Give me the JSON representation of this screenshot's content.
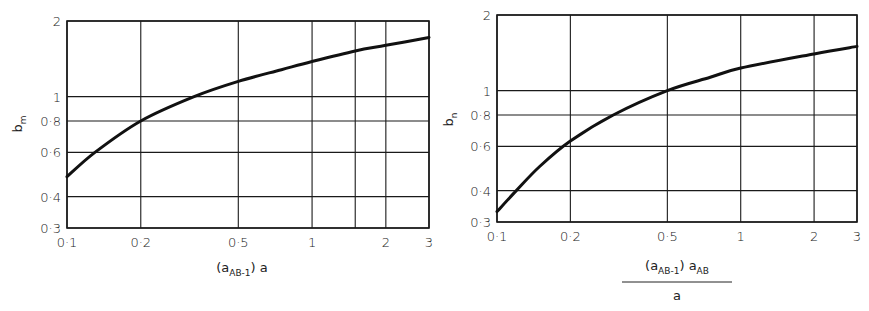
{
  "chart_data": [
    {
      "type": "line",
      "title": "",
      "xscale": "log",
      "yscale": "log",
      "xlabel": "(a_AB-1) a",
      "xlabel_parts": {
        "open": "(a",
        "sub": "AB-1",
        "close": ") a"
      },
      "ylabel": "b_m",
      "ylabel_parts": {
        "main": "b",
        "sub": "m"
      },
      "xlim": [
        0.1,
        3
      ],
      "ylim": [
        0.3,
        2
      ],
      "xticks": [
        0.1,
        0.2,
        0.5,
        1,
        2,
        3
      ],
      "xtick_labels": [
        "0·1",
        "0·2",
        "0·5",
        "1",
        "2",
        "3"
      ],
      "x_gridlines": [
        0.1,
        0.2,
        0.5,
        1,
        1.5,
        2,
        3
      ],
      "yticks": [
        0.3,
        0.4,
        0.6,
        0.8,
        1,
        2
      ],
      "ytick_labels": [
        "0·3",
        "0·4",
        "0·6",
        "0·8",
        "1",
        "2"
      ],
      "y_gridlines": [
        0.3,
        0.4,
        0.6,
        0.8,
        1,
        2
      ],
      "grid": true,
      "legend": null,
      "series": [
        {
          "name": "b_m",
          "x": [
            0.1,
            0.13,
            0.2,
            0.33,
            0.5,
            0.75,
            1,
            1.5,
            2,
            3
          ],
          "y": [
            0.48,
            0.6,
            0.8,
            1.0,
            1.15,
            1.28,
            1.38,
            1.52,
            1.6,
            1.72
          ]
        }
      ]
    },
    {
      "type": "line",
      "title": "",
      "xscale": "log",
      "yscale": "log",
      "xlabel": "(a_AB-1) a_AB / a",
      "xlabel_parts": {
        "num_open": "(a",
        "num_sub1": "AB-1",
        "num_mid": ") a",
        "num_sub2": "AB",
        "den": "a"
      },
      "ylabel": "b_n",
      "ylabel_parts": {
        "main": "b",
        "sub": "n"
      },
      "xlim": [
        0.1,
        3
      ],
      "ylim": [
        0.3,
        2
      ],
      "xticks": [
        0.1,
        0.2,
        0.5,
        1,
        2,
        3
      ],
      "xtick_labels": [
        "0·1",
        "0·2",
        "0·5",
        "1",
        "2",
        "3"
      ],
      "x_gridlines": [
        0.1,
        0.2,
        0.5,
        1,
        2,
        3
      ],
      "yticks": [
        0.3,
        0.4,
        0.6,
        0.8,
        1,
        2
      ],
      "ytick_labels": [
        "0·3",
        "0·4",
        "0·6",
        "0·8",
        "1",
        "2"
      ],
      "y_gridlines": [
        0.3,
        0.4,
        0.6,
        0.8,
        1,
        2
      ],
      "grid": true,
      "legend": null,
      "series": [
        {
          "name": "b_n",
          "x": [
            0.1,
            0.12,
            0.15,
            0.2,
            0.3,
            0.5,
            0.75,
            1,
            2,
            3
          ],
          "y": [
            0.33,
            0.4,
            0.5,
            0.63,
            0.8,
            1.0,
            1.13,
            1.23,
            1.4,
            1.5
          ]
        }
      ]
    }
  ],
  "colors": {
    "line": "#111111",
    "grid": "#1a1a1a",
    "background": "#ffffff"
  }
}
